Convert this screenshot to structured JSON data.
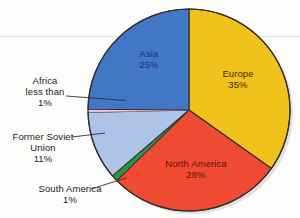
{
  "figure": {
    "background_color": "#fcfcfa",
    "rule_color": "#d8dadb",
    "rule_y": 36
  },
  "chart_data": {
    "type": "pie",
    "title": "",
    "subtitle": "",
    "xlabel": "",
    "ylabel": "",
    "legend_position": "none",
    "grid": false,
    "labels_inside": [
      "Asia",
      "Europe",
      "North America"
    ],
    "labels_outside": [
      "Africa",
      "Former Soviet Union",
      "South America"
    ],
    "start_angle_deg": 0,
    "direction": "clockwise",
    "categories": [
      "Europe",
      "North America",
      "South America",
      "Former Soviet Union",
      "Africa",
      "Asia"
    ],
    "values": [
      35,
      28,
      1,
      11,
      0.5,
      25
    ],
    "value_labels": [
      "35%",
      "28%",
      "1%",
      "11%",
      "less than 1%",
      "25%"
    ],
    "colors": [
      "#f2c21c",
      "#ef4b32",
      "#2e9244",
      "#aec3e8",
      "#f6c8c8",
      "#4277c6"
    ],
    "slices": [
      {
        "name": "Europe",
        "label": "Europe",
        "value": 35,
        "value_label": "35%",
        "color": "#f2c21c",
        "text_color": "#3c2c05",
        "placement": "inside",
        "start_deg": 0,
        "end_deg": 126
      },
      {
        "name": "North America",
        "label": "North America",
        "value": 28,
        "value_label": "28%",
        "color": "#ef4b32",
        "text_color": "#5e1206",
        "placement": "inside",
        "start_deg": 126,
        "end_deg": 226.8
      },
      {
        "name": "South America",
        "label": "South America",
        "value": 1,
        "value_label": "1%",
        "color": "#2e9244",
        "text_color": "#1d1d1d",
        "placement": "outside",
        "start_deg": 226.8,
        "end_deg": 234
      },
      {
        "name": "Former Soviet Union",
        "label": "Former Soviet Union",
        "value": 11,
        "value_label": "11%",
        "color": "#aec3e8",
        "text_color": "#1d1d1d",
        "placement": "outside",
        "start_deg": 234,
        "end_deg": 273.6
      },
      {
        "name": "Africa",
        "label": "Africa",
        "value": 0.5,
        "value_label": "less than 1%",
        "color": "#f6c8c8",
        "text_color": "#1d1d1d",
        "placement": "outside",
        "start_deg": 273.6,
        "end_deg": 277.2
      },
      {
        "name": "Asia",
        "label": "Asia",
        "value": 25,
        "value_label": "25%",
        "color": "#4277c6",
        "text_color": "#14306e",
        "placement": "inside",
        "start_deg": 277.2,
        "end_deg": 360
      }
    ]
  },
  "labels": {
    "asia": {
      "name": "Asia",
      "value": "25%"
    },
    "europe": {
      "name": "Europe",
      "value": "35%"
    },
    "north_america": {
      "name": "North America",
      "value": "28%"
    },
    "africa": {
      "name": "Africa",
      "qualifier": "less than",
      "value": "1%"
    },
    "former_soviet_union": {
      "name_line1": "Former Soviet",
      "name_line2": "Union",
      "value": "11%"
    },
    "south_america": {
      "name": "South America",
      "value": "1%"
    }
  }
}
